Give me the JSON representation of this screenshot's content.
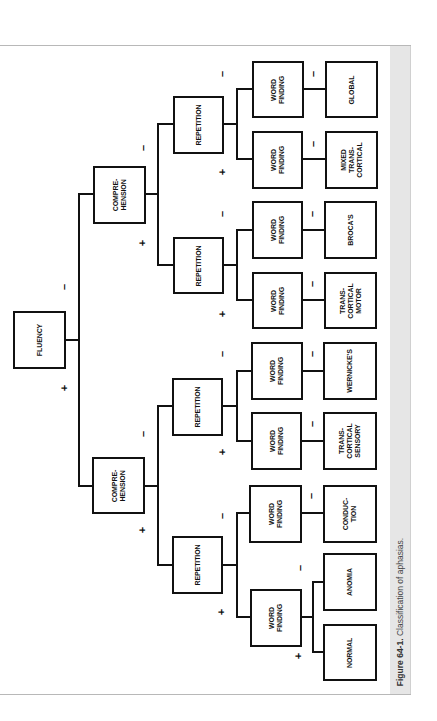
{
  "figure": {
    "caption_number": "Figure 64-1.",
    "caption_text": " Classification of aphasias."
  },
  "nodes": {
    "fluency": "FLUENCY",
    "comprehension_a": "COMPRE-\nHENSION",
    "comprehension_b": "COMPRE-\nHENSION",
    "repetition_a1": "REPETITION",
    "repetition_a2": "REPETITION",
    "repetition_b1": "REPETITION",
    "repetition_b2": "REPETITION",
    "word_finding_1": "WORD\nFINDING",
    "word_finding_2": "WORD\nFINDING",
    "word_finding_3": "WORD\nFINDING",
    "word_finding_4": "WORD\nFINDING",
    "word_finding_5": "WORD\nFINDING",
    "word_finding_6": "WORD\nFINDING",
    "word_finding_7": "WORD\nFINDING",
    "word_finding_8": "WORD\nFINDING"
  },
  "outcomes": {
    "global": "GLOBAL",
    "mixed_transcortical": "MIXED\nTRANS-\nCORTICAL",
    "brocas": "BROCA'S",
    "transcortical_motor": "TRANS-\nCORTICAL\nMOTOR",
    "wernickes": "WERNICKE'S",
    "transcortical_sensory": "TRANS-\nCORTICAL\nSENSORY",
    "conduction": "CONDUC-\nTION",
    "anomia": "ANOMIA",
    "normal": "NORMAL"
  },
  "signs": {
    "plus": "+",
    "minus": "–"
  },
  "tree": {
    "root": "FLUENCY",
    "minus": {
      "node": "COMPREHENSION",
      "minus": {
        "node": "REPETITION",
        "minus": {
          "node": "WORD FINDING",
          "minus": "GLOBAL"
        },
        "plus": {
          "node": "WORD FINDING",
          "minus": "MIXED TRANSCORTICAL"
        }
      },
      "plus": {
        "node": "REPETITION",
        "minus": {
          "node": "WORD FINDING",
          "minus": "BROCA'S"
        },
        "plus": {
          "node": "WORD FINDING",
          "minus": "TRANSCORTICAL MOTOR"
        }
      }
    },
    "plus": {
      "node": "COMPREHENSION",
      "minus": {
        "node": "REPETITION",
        "minus": {
          "node": "WORD FINDING",
          "minus": "WERNICKE'S"
        },
        "plus": {
          "node": "WORD FINDING",
          "minus": "TRANSCORTICAL SENSORY"
        }
      },
      "plus": {
        "node": "REPETITION",
        "minus": {
          "node": "WORD FINDING",
          "minus": "CONDUCTION"
        },
        "plus": {
          "node": "WORD FINDING",
          "minus": "ANOMIA",
          "plus": "NORMAL"
        }
      }
    }
  }
}
